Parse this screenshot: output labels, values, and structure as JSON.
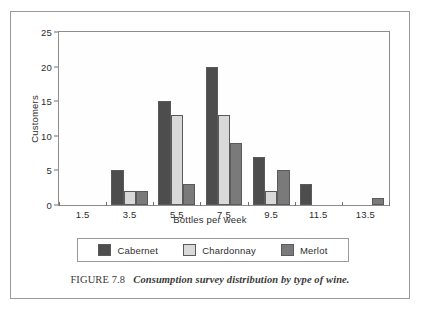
{
  "figure": {
    "caption_prefix": "FIGURE 7.8",
    "caption_text": "Consumption survey distribution by type of wine."
  },
  "chart_data": {
    "type": "bar",
    "title": "",
    "subtitle": "",
    "xlabel": "Bottles per week",
    "ylabel": "Customers",
    "categories": [
      "1.5",
      "3.5",
      "5.5",
      "7.5",
      "9.5",
      "11.5",
      "13.5"
    ],
    "series": [
      {
        "name": "Cabernet",
        "color": "#4d4d4d",
        "values": [
          0,
          5,
          15,
          20,
          7,
          3,
          0
        ]
      },
      {
        "name": "Chardonnay",
        "color": "#d9d9d9",
        "values": [
          0,
          2,
          13,
          13,
          2,
          0,
          0
        ]
      },
      {
        "name": "Merlot",
        "color": "#7a7a7a",
        "values": [
          0,
          2,
          3,
          9,
          5,
          0,
          1
        ]
      }
    ],
    "ylim": [
      0,
      25
    ],
    "yticks": [
      0,
      5,
      10,
      15,
      20,
      25
    ],
    "ytick_labels": [
      "0",
      "5",
      "10",
      "15",
      "20",
      "25"
    ],
    "xtick_labels": [
      "1.5",
      "3.5",
      "5.5",
      "7.5",
      "9.5",
      "11.5",
      "13.5"
    ],
    "grid": false,
    "legend_position": "bottom",
    "legend_entries": [
      "Cabernet",
      "Chardonnay",
      "Merlot"
    ]
  }
}
